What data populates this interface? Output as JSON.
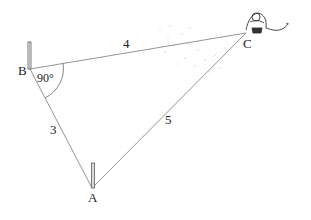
{
  "diagram": {
    "type": "right-triangle-measurement",
    "points": {
      "A": {
        "label": "A",
        "x": 92,
        "y": 188
      },
      "B": {
        "label": "B",
        "x": 30,
        "y": 69
      },
      "C": {
        "label": "C",
        "x": 246,
        "y": 33
      }
    },
    "sides": {
      "AB": {
        "label": "3"
      },
      "BC": {
        "label": "4"
      },
      "AC": {
        "label": "5"
      }
    },
    "angle_B": {
      "label": "90°"
    },
    "colors": {
      "line": "#888888",
      "text": "#222222",
      "stake": "#555555"
    }
  }
}
